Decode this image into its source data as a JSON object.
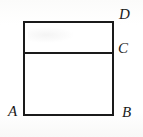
{
  "figure": {
    "kind": "geometry-diagram",
    "background_color": "#fdfdfc",
    "stroke_color": "#1a1a1a",
    "stroke_width": 2,
    "canvas": {
      "width": 143,
      "height": 137
    },
    "rectangle": {
      "left": 24,
      "top": 22,
      "right": 113,
      "bottom": 115,
      "width": 89,
      "height": 93
    },
    "divider": {
      "name": "horizontal-divider",
      "y": 53,
      "x_start": 24,
      "x_end": 113
    },
    "labels": [
      {
        "id": "A",
        "text": "A",
        "position": "bottom-left-outside",
        "x": 8,
        "y": 104
      },
      {
        "id": "B",
        "text": "B",
        "position": "bottom-right-outside",
        "x": 122,
        "y": 105
      },
      {
        "id": "C",
        "text": "C",
        "position": "right-at-divider",
        "x": 118,
        "y": 41
      },
      {
        "id": "D",
        "text": "D",
        "position": "top-right-outside",
        "x": 119,
        "y": 7
      }
    ]
  }
}
